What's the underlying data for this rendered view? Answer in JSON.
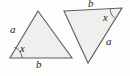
{
  "figure": {
    "kind": "geometry-diagram",
    "background_color": "#fdfdfc",
    "shapes": [
      {
        "name": "left-triangle",
        "orientation": "apex-up",
        "fill_color": "#f0efed",
        "stroke_color": "#5c5c5c",
        "points": "38,11 72,58 10,58",
        "angle_mark": {
          "vertex": "10,58",
          "arc_path": "M 22,58 A 12,12 0 0 0 14.2,47.2",
          "stroke_color": "#5c5c5c"
        },
        "labels": [
          {
            "name": "side-a-label",
            "text": "a",
            "x": 10,
            "y": 24
          },
          {
            "name": "side-b-label",
            "text": "b",
            "x": 36,
            "y": 59
          },
          {
            "name": "angle-x-label",
            "text": "x",
            "x": 20,
            "y": 44
          }
        ]
      },
      {
        "name": "right-triangle",
        "orientation": "apex-down",
        "fill_color": "#f0efed",
        "stroke_color": "#5c5c5c",
        "points": "64,11 122,8 88,63",
        "angle_mark": {
          "vertex": "122,8",
          "arc_path": "M 110.2,8.6 A 12,12 0 0 0 115.4,18.5",
          "stroke_color": "#5c5c5c"
        },
        "labels": [
          {
            "name": "side-b-label",
            "text": "b",
            "x": 88,
            "y": -2
          },
          {
            "name": "side-a-label",
            "text": "a",
            "x": 106,
            "y": 36
          },
          {
            "name": "angle-x-label",
            "text": "x",
            "x": 103,
            "y": 13
          }
        ]
      }
    ]
  }
}
